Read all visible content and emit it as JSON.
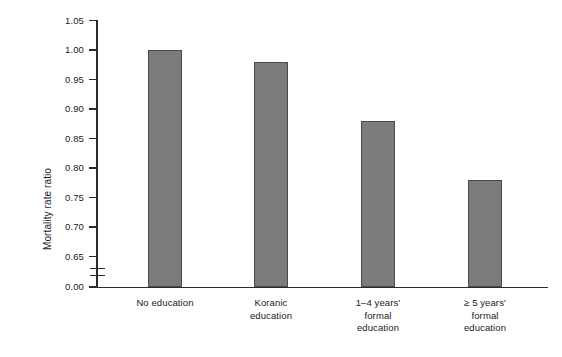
{
  "chart_data": {
    "type": "bar",
    "title": "",
    "subtitle": "",
    "xlabel": "",
    "ylabel": "Mortality rate ratio",
    "categories": [
      "No education",
      "Koranic education",
      "1–4 years' formal education",
      "≥ 5 years' formal education"
    ],
    "category_lines": [
      [
        "No education"
      ],
      [
        "Koranic",
        "education"
      ],
      [
        "1–4 years'",
        "formal",
        "education"
      ],
      [
        "≥ 5 years'",
        "formal",
        "education"
      ]
    ],
    "values": [
      1.0,
      0.98,
      0.88,
      0.78
    ],
    "value_labels": [
      "1.00",
      "0.98",
      "0.88",
      "0.78"
    ],
    "ylim": [
      0.625,
      1.05
    ],
    "axis_break": true,
    "axis_break_between": [
      0.0,
      0.65
    ],
    "ytick_labels": [
      "1.05",
      "1.00",
      "0.95",
      "0.90",
      "0.85",
      "0.80",
      "0.75",
      "0.70",
      "0.65",
      "0.00"
    ],
    "ytick_values": [
      1.05,
      1.0,
      0.95,
      0.9,
      0.85,
      0.8,
      0.75,
      0.7,
      0.65,
      0.0
    ],
    "grid": false,
    "legend": false,
    "legend_position": "none",
    "bar_color": "#7b7b7b",
    "bar_edge_color": "#4a4a4a",
    "axis_color": "#2b2b2b",
    "background_color": "#ffffff"
  }
}
